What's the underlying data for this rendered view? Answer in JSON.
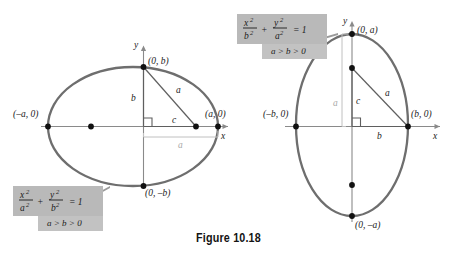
{
  "figure": {
    "caption": "Figure 10.18",
    "colors": {
      "ellipse_stroke": "#6e6e6e",
      "axis": "#8a8a8a",
      "point": "#111111",
      "triangle": "#5f5f5f",
      "box_fill": "#b9b9b9",
      "box_shadow": "#c9c9c9",
      "faint_label": "#a9a9a9",
      "background": "#ffffff"
    }
  },
  "left_panel": {
    "name": "horizontal-ellipse",
    "axis_x_label": "x",
    "axis_y_label": "y",
    "vertices": [
      {
        "key": "left_vertex",
        "label": "(–a, 0)"
      },
      {
        "key": "right_vertex",
        "label": "(a, 0)"
      },
      {
        "key": "top_vertex",
        "label": "(0, b)"
      },
      {
        "key": "bottom_vertex",
        "label": "(0, –b)"
      }
    ],
    "segments": [
      {
        "key": "semi_minor",
        "label": "b"
      },
      {
        "key": "focal_distance",
        "label": "c"
      },
      {
        "key": "hypotenuse",
        "label": "a"
      },
      {
        "key": "semi_major_faint",
        "label": "a"
      }
    ],
    "equation_box": {
      "numerator_1": "x",
      "denominator_1": "a",
      "numerator_2": "y",
      "denominator_2": "b",
      "plus": "+",
      "equals": "= 1",
      "exponent": "2",
      "condition": "a > b > 0"
    }
  },
  "right_panel": {
    "name": "vertical-ellipse",
    "axis_x_label": "x",
    "axis_y_label": "y",
    "vertices": [
      {
        "key": "left_vertex",
        "label": "(–b, 0)"
      },
      {
        "key": "right_vertex",
        "label": "(b, 0)"
      },
      {
        "key": "top_vertex",
        "label": "(0, a)"
      },
      {
        "key": "bottom_vertex",
        "label": "(0, –a)"
      }
    ],
    "segments": [
      {
        "key": "focal_distance",
        "label": "c"
      },
      {
        "key": "semi_minor",
        "label": "b"
      },
      {
        "key": "hypotenuse",
        "label": "a"
      },
      {
        "key": "semi_major_faint",
        "label": "a"
      }
    ],
    "equation_box": {
      "numerator_1": "x",
      "denominator_1": "b",
      "numerator_2": "y",
      "denominator_2": "a",
      "plus": "+",
      "equals": "= 1",
      "exponent": "2",
      "condition": "a > b > 0"
    }
  }
}
